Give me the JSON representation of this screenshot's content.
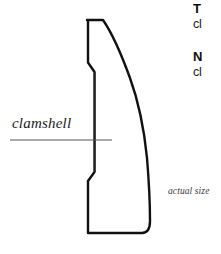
{
  "figure": {
    "type": "technical-illustration",
    "background_color": "#ffffff",
    "outline_color": "#111111",
    "leader_line_color": "#555555"
  },
  "callout": {
    "label": "clamshell",
    "leader_line": {
      "start_x": 10,
      "end_x": 112,
      "y": 140
    }
  },
  "scale_note": {
    "text": "actual size"
  },
  "side_text": {
    "block_1": {
      "heading": "T",
      "body": "cl"
    },
    "block_2": {
      "heading": "N",
      "body": "cl"
    }
  },
  "chart_data": {
    "type": "line",
    "xlabel": "",
    "ylabel": "",
    "xlim": [
      0,
      221
    ],
    "ylim": [
      0,
      254
    ],
    "grid": false,
    "series": [
      {
        "name": "profile-outline",
        "points": [
          [
            87,
            20
          ],
          [
            103,
            20
          ],
          [
            118,
            45
          ],
          [
            131,
            80
          ],
          [
            141,
            120
          ],
          [
            147,
            160
          ],
          [
            150,
            200
          ],
          [
            150,
            224
          ],
          [
            145,
            233
          ],
          [
            87,
            233
          ],
          [
            87,
            180
          ],
          [
            94,
            172
          ],
          [
            94,
            72
          ],
          [
            87,
            62
          ],
          [
            87,
            20
          ]
        ]
      },
      {
        "name": "reveal-line",
        "points": [
          [
            95,
            72
          ],
          [
            95,
            172
          ]
        ]
      }
    ]
  }
}
